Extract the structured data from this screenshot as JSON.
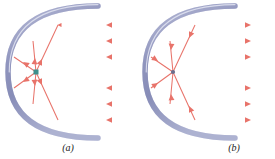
{
  "figure": {
    "background_color": "#ffffff",
    "width": 275,
    "height": 159,
    "panels": [
      {
        "id": "a",
        "label": "(a)",
        "label_x": 68,
        "label_y": 150,
        "caption_meaning": "Parallel incoming rays converge at the focus",
        "ray_direction": "left",
        "ray_direction_note": "arrowheads point left (toward the mirror) on the incoming horizontal rays",
        "focus": {
          "x": 36,
          "y": 72,
          "marker": "square",
          "color": "#3e8f8c",
          "size": 5
        },
        "mirror": {
          "vertex_x": 8,
          "vertex_y": 72,
          "half_height": 66,
          "band_color": "#9a9ec4",
          "band_edge_color": "#6f74a3",
          "band_highlight_color": "#d4d7ea",
          "thickness": 5,
          "coefficient": 0.00874
        },
        "rays": {
          "color": "#e8736a",
          "fade_color": "#f6b9b4",
          "count": 6,
          "y_values": [
            25,
            41,
            57,
            88,
            104,
            120
          ],
          "x_start": 132,
          "arrow_x": [
            112,
            112,
            112,
            112,
            112,
            112
          ]
        }
      },
      {
        "id": "b",
        "label": "(b)",
        "label_x": 234,
        "label_y": 150,
        "caption_meaning": "Rays from the focus emerge parallel to the axis",
        "ray_direction": "right",
        "ray_direction_note": "arrowheads point right (away from the mirror) on the outgoing horizontal rays",
        "focus": {
          "x": 173,
          "y": 72,
          "marker": "dot",
          "color": "#6b6f8e",
          "size": 4
        },
        "mirror": {
          "vertex_x": 145,
          "vertex_y": 72,
          "half_height": 66,
          "band_color": "#9a9ec4",
          "band_edge_color": "#6f74a3",
          "band_highlight_color": "#d4d7ea",
          "thickness": 5,
          "coefficient": 0.00874
        },
        "rays": {
          "color": "#e8736a",
          "fade_color": "#f6b9b4",
          "count": 6,
          "y_values": [
            25,
            41,
            57,
            88,
            104,
            120
          ],
          "x_end": 275,
          "arrow_x": [
            250,
            250,
            250,
            250,
            250,
            250
          ]
        }
      }
    ],
    "colors": {
      "ray": "#e8736a",
      "ray_light": "#f6b9b4",
      "mirror_band": "#9a9ec4",
      "mirror_edge": "#6f74a3",
      "mirror_highlight": "#d4d7ea",
      "focus_a": "#3e8f8c",
      "focus_b": "#6b6f8e",
      "label_text": "#1a1a1a",
      "background": "#ffffff"
    }
  }
}
